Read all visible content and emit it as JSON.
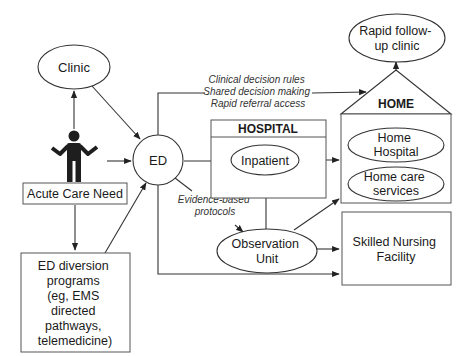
{
  "diagram": {
    "type": "flow",
    "nodes": {
      "clinic": {
        "label": "Clinic"
      },
      "patient": {
        "icon": "person-icon",
        "label": "Acute Care Need"
      },
      "ed": {
        "label": "ED"
      },
      "ed_diversion": {
        "lines": [
          "ED diversion",
          "programs",
          "(eg, EMS",
          "directed",
          "pathways,",
          "telemedicine)"
        ]
      },
      "hospital": {
        "title": "HOSPITAL",
        "inpatient": "Inpatient"
      },
      "observation": {
        "lines": [
          "Observation",
          "Unit"
        ]
      },
      "home": {
        "title": "HOME",
        "home_hospital": [
          "Home",
          "Hospital"
        ],
        "home_care": [
          "Home care",
          "services"
        ]
      },
      "rapid_followup": {
        "lines": [
          "Rapid follow-",
          "up clinic"
        ]
      },
      "snf": {
        "lines": [
          "Skilled Nursing",
          "Facility"
        ]
      }
    },
    "annotations": {
      "ed_to_home": [
        "Clinical decision rules",
        "Shared decision making",
        "Rapid referral access"
      ],
      "ed_to_observation": [
        "Evidence-based",
        "protocols"
      ]
    },
    "edges": [
      [
        "patient",
        "clinic"
      ],
      [
        "clinic",
        "ed"
      ],
      [
        "patient",
        "ed"
      ],
      [
        "patient",
        "ed_diversion"
      ],
      [
        "ed_diversion",
        "ed"
      ],
      [
        "ed",
        "inpatient"
      ],
      [
        "ed",
        "home"
      ],
      [
        "ed",
        "observation"
      ],
      [
        "ed",
        "snf"
      ],
      [
        "observation",
        "inpatient"
      ],
      [
        "observation",
        "home"
      ],
      [
        "observation",
        "snf"
      ],
      [
        "inpatient",
        "home"
      ],
      [
        "home",
        "rapid_followup"
      ]
    ]
  }
}
